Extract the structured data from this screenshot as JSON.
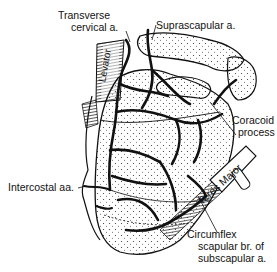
{
  "diagram": {
    "labels": {
      "transverse_cervical": [
        "Transverse",
        "cervical a."
      ],
      "suprascapular": "Suprascapular a.",
      "coracoid": [
        "Coracoid",
        "process"
      ],
      "intercostal": "Intercostal aa.",
      "circumflex": [
        "Circumflex",
        "scapular br. of",
        "subscapular a."
      ]
    },
    "muscle_labels": {
      "levator": "Levator",
      "teres_major": "Teres Major"
    },
    "colors": {
      "ink": "#111111",
      "background": "#ffffff",
      "bone_fill": "#f4f4f4"
    }
  }
}
